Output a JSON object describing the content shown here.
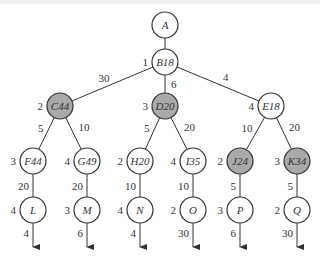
{
  "diagram": {
    "type": "search-tree",
    "colors": {
      "stroke": "#333333",
      "shaded_fill": "#a9a9a9",
      "plain_fill": "#ffffff"
    },
    "nodes": [
      {
        "id": "A",
        "label": "A",
        "side": "",
        "x": 165,
        "y": 25,
        "shaded": false
      },
      {
        "id": "B",
        "label": "B18",
        "side": "1",
        "x": 165,
        "y": 62,
        "shaded": false
      },
      {
        "id": "C",
        "label": "C44",
        "side": "2",
        "x": 60,
        "y": 106,
        "shaded": true
      },
      {
        "id": "D",
        "label": "D20",
        "side": "3",
        "x": 165,
        "y": 106,
        "shaded": true
      },
      {
        "id": "E",
        "label": "E18",
        "side": "4",
        "x": 271,
        "y": 106,
        "shaded": false
      },
      {
        "id": "F",
        "label": "F44",
        "side": "3",
        "x": 33,
        "y": 161,
        "shaded": false
      },
      {
        "id": "G",
        "label": "G49",
        "side": "4",
        "x": 87,
        "y": 161,
        "shaded": false
      },
      {
        "id": "H",
        "label": "H20",
        "side": "2",
        "x": 140,
        "y": 161,
        "shaded": false
      },
      {
        "id": "I",
        "label": "I35",
        "side": "4",
        "x": 193,
        "y": 161,
        "shaded": false
      },
      {
        "id": "J",
        "label": "J24",
        "side": "2",
        "x": 240,
        "y": 161,
        "shaded": true
      },
      {
        "id": "K",
        "label": "K34",
        "side": "3",
        "x": 297,
        "y": 161,
        "shaded": true
      },
      {
        "id": "L",
        "label": "L",
        "side": "4",
        "x": 33,
        "y": 210,
        "shaded": false
      },
      {
        "id": "M",
        "label": "M",
        "side": "3",
        "x": 87,
        "y": 210,
        "shaded": false
      },
      {
        "id": "N",
        "label": "N",
        "side": "4",
        "x": 140,
        "y": 210,
        "shaded": false
      },
      {
        "id": "O",
        "label": "O",
        "side": "2",
        "x": 193,
        "y": 210,
        "shaded": false
      },
      {
        "id": "P",
        "label": "P",
        "side": "3",
        "x": 240,
        "y": 210,
        "shaded": false
      },
      {
        "id": "Q",
        "label": "Q",
        "side": "2",
        "x": 297,
        "y": 210,
        "shaded": false
      }
    ],
    "edges": [
      {
        "from": "A",
        "to": "B",
        "weight": ""
      },
      {
        "from": "B",
        "to": "C",
        "weight": "30"
      },
      {
        "from": "B",
        "to": "D",
        "weight": "6"
      },
      {
        "from": "B",
        "to": "E",
        "weight": "4"
      },
      {
        "from": "C",
        "to": "F",
        "weight": "5"
      },
      {
        "from": "C",
        "to": "G",
        "weight": "10"
      },
      {
        "from": "D",
        "to": "H",
        "weight": "5"
      },
      {
        "from": "D",
        "to": "I",
        "weight": "20"
      },
      {
        "from": "E",
        "to": "J",
        "weight": "10"
      },
      {
        "from": "E",
        "to": "K",
        "weight": "20"
      },
      {
        "from": "F",
        "to": "L",
        "weight": "20"
      },
      {
        "from": "G",
        "to": "M",
        "weight": "20"
      },
      {
        "from": "H",
        "to": "N",
        "weight": "10"
      },
      {
        "from": "I",
        "to": "O",
        "weight": "10"
      },
      {
        "from": "J",
        "to": "P",
        "weight": "5"
      },
      {
        "from": "K",
        "to": "Q",
        "weight": "5"
      }
    ],
    "exits": [
      {
        "from": "L",
        "weight": "4"
      },
      {
        "from": "M",
        "weight": "6"
      },
      {
        "from": "N",
        "weight": "4"
      },
      {
        "from": "O",
        "weight": "30"
      },
      {
        "from": "P",
        "weight": "6"
      },
      {
        "from": "Q",
        "weight": "30"
      }
    ]
  }
}
